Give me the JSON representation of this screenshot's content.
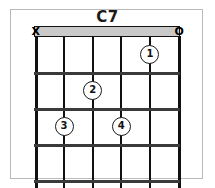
{
  "card": {
    "title": "C7",
    "background_color": "#ffffff",
    "frame_color": "#b9b9b9"
  },
  "diagram": {
    "type": "guitar-chord-diagram",
    "string_count": 6,
    "fret_count": 4,
    "nut_shown": true,
    "nut_color": "#c9c9c9",
    "line_color": "#111111",
    "string_markers": [
      {
        "string": 1,
        "symbol": "X",
        "meaning": "muted"
      },
      {
        "string": 6,
        "symbol": "O",
        "meaning": "open"
      }
    ],
    "finger_positions": [
      {
        "label": "1",
        "string": 5,
        "fret": 1
      },
      {
        "label": "2",
        "string": 3,
        "fret": 2
      },
      {
        "label": "3",
        "string": 2,
        "fret": 3
      },
      {
        "label": "4",
        "string": 4,
        "fret": 3
      }
    ]
  }
}
